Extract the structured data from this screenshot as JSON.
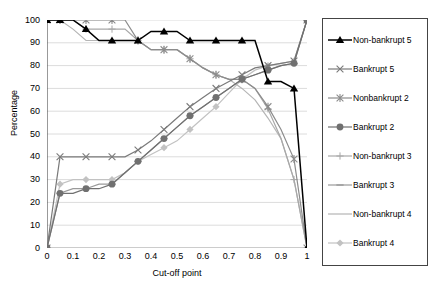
{
  "chart_data": {
    "type": "line",
    "title": "",
    "xlabel": "Cut-off point",
    "ylabel": "Percentage",
    "xlim": [
      0,
      1
    ],
    "ylim": [
      0,
      100
    ],
    "xticks": [
      "0",
      "0.1",
      "0.2",
      "0.3",
      "0.4",
      "0.5",
      "0.6",
      "0.7",
      "0.8",
      "0.9",
      "1"
    ],
    "yticks": [
      "0",
      "10",
      "20",
      "30",
      "40",
      "50",
      "60",
      "70",
      "80",
      "90",
      "100"
    ],
    "grid": "horizontal",
    "legend_position": "right-outside",
    "x": [
      0,
      0.05,
      0.1,
      0.15,
      0.2,
      0.25,
      0.3,
      0.35,
      0.4,
      0.45,
      0.5,
      0.55,
      0.6,
      0.65,
      0.7,
      0.75,
      0.8,
      0.85,
      0.9,
      0.95,
      1
    ],
    "series": [
      {
        "name": "Non-bankrupt 5",
        "marker": "triangle-filled",
        "color": "#000000",
        "values": [
          100,
          100,
          100,
          96,
          91,
          91,
          91,
          91,
          95,
          95,
          95,
          91,
          91,
          91,
          91,
          91,
          91,
          73,
          73,
          70,
          0
        ]
      },
      {
        "name": "Bankrupt 5",
        "marker": "cross",
        "color": "#7a7a7a",
        "values": [
          0,
          40,
          40,
          40,
          40,
          40,
          40,
          43,
          47,
          52,
          57,
          62,
          66,
          70,
          73,
          76,
          79,
          80,
          81,
          82,
          100
        ]
      },
      {
        "name": "Nonbankrupt 2",
        "marker": "asterisk",
        "color": "#8c8c8c",
        "values": [
          100,
          100,
          100,
          100,
          100,
          100,
          100,
          91,
          87,
          87,
          87,
          83,
          79,
          76,
          74,
          74,
          70,
          62,
          52,
          39,
          0
        ]
      },
      {
        "name": "Bankrupt 2",
        "marker": "circle-filled",
        "color": "#707070",
        "values": [
          0,
          24,
          24,
          26,
          26,
          28,
          33,
          38,
          43,
          48,
          53,
          58,
          62,
          66,
          70,
          74,
          76,
          78,
          80,
          81,
          100
        ]
      },
      {
        "name": "Non-bankrupt 3",
        "marker": "plus",
        "color": "#a8a8a8",
        "values": [
          100,
          100,
          100,
          96,
          96,
          96,
          96,
          91,
          87,
          87,
          87,
          83,
          79,
          76,
          74,
          74,
          70,
          61,
          48,
          30,
          0
        ]
      },
      {
        "name": "Bankrupt 3",
        "marker": "dash",
        "color": "#9a9a9a",
        "values": [
          0,
          24,
          26,
          26,
          28,
          28,
          33,
          38,
          43,
          48,
          53,
          58,
          62,
          66,
          70,
          74,
          76,
          78,
          80,
          81,
          100
        ]
      },
      {
        "name": "Non-bankrupt 4",
        "marker": "line",
        "color": "#b5b5b5",
        "values": [
          100,
          100,
          96,
          91,
          91,
          91,
          91,
          91,
          87,
          87,
          87,
          83,
          79,
          76,
          74,
          70,
          65,
          57,
          48,
          30,
          0
        ]
      },
      {
        "name": "Bankrupt 4",
        "marker": "diamond",
        "color": "#c2c2c2",
        "values": [
          0,
          28,
          30,
          30,
          30,
          30,
          33,
          38,
          41,
          44,
          47,
          52,
          57,
          62,
          68,
          74,
          78,
          80,
          81,
          82,
          100
        ]
      }
    ]
  }
}
